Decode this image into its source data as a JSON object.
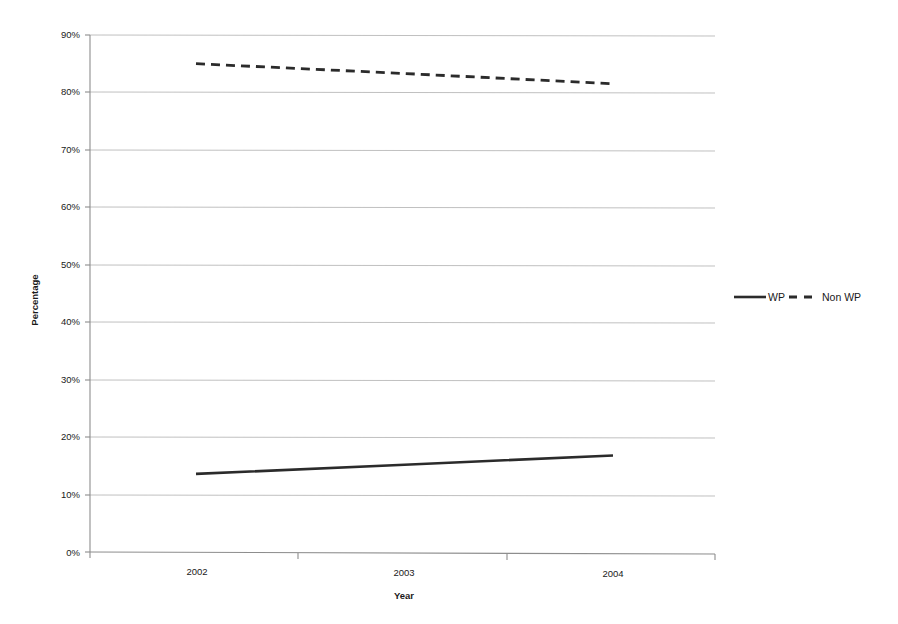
{
  "chart_data": {
    "type": "line",
    "title": "",
    "subtitle": "",
    "xlabel": "Year",
    "ylabel": "Percentage",
    "categories": [
      "2002",
      "2003",
      "2004"
    ],
    "x": [
      2002,
      2003,
      2004
    ],
    "series": [
      {
        "name": "WP",
        "values": [
          13.6,
          15.2,
          16.8
        ],
        "style": "solid"
      },
      {
        "name": "Non WP",
        "values": [
          85.0,
          83.3,
          81.5
        ],
        "style": "dashed"
      }
    ],
    "ylim": [
      0,
      90
    ],
    "ytick_step": 10,
    "ytick_labels": [
      "0%",
      "10%",
      "20%",
      "30%",
      "40%",
      "50%",
      "60%",
      "70%",
      "80%",
      "90%"
    ],
    "ytick_values": [
      0,
      10,
      20,
      30,
      40,
      50,
      60,
      70,
      80,
      90
    ],
    "xtick_labels": [
      "2002",
      "2003",
      "2004"
    ],
    "grid": "horizontal",
    "legend_position": "right",
    "legend_entries": [
      "WP",
      "Non WP"
    ],
    "colors": {
      "series": "#2b2b2b",
      "gridline": "#b9b9b9",
      "axis": "#8d8d8d",
      "text": "#1a1a1a",
      "background": "#ffffff"
    }
  },
  "axis": {
    "y_title": "Percentage",
    "x_title": "Year",
    "y_labels": {
      "t0": "0%",
      "t1": "10%",
      "t2": "20%",
      "t3": "30%",
      "t4": "40%",
      "t5": "50%",
      "t6": "60%",
      "t7": "70%",
      "t8": "80%",
      "t9": "90%"
    },
    "x_labels": {
      "c0": "2002",
      "c1": "2003",
      "c2": "2004"
    }
  },
  "legend": {
    "items": [
      {
        "label": "WP",
        "style": "solid"
      },
      {
        "label": "Non WP",
        "style": "dashed"
      }
    ],
    "label_wp": "WP",
    "label_non_wp": "Non WP"
  }
}
